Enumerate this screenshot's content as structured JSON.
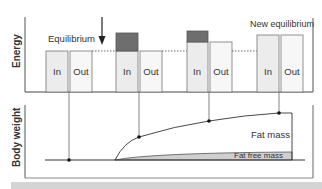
{
  "energy_panel": {
    "axis_label": "Energy",
    "labels": {
      "equilibrium": "Equilibrium",
      "new_equilibrium": "New equilibrium"
    },
    "bar_pairs": [
      {
        "in_label": "In",
        "out_label": "Out",
        "state": "equilibrium"
      },
      {
        "in_label": "In",
        "out_label": "Out",
        "state": "surplus"
      },
      {
        "in_label": "In",
        "out_label": "Out",
        "state": "smaller surplus"
      },
      {
        "in_label": "In",
        "out_label": "Out",
        "state": "new equilibrium"
      }
    ]
  },
  "body_weight_panel": {
    "axis_label": "Body weight",
    "labels": {
      "fat_mass": "Fat mass",
      "fat_free_mass": "Fat free mass"
    }
  },
  "colors": {
    "bar_fill": "#ececec",
    "surplus_fill": "#6e6e6e",
    "fat_free_fill": "#cfcfcf",
    "line": "#333333",
    "band": "#d4d4d4"
  }
}
